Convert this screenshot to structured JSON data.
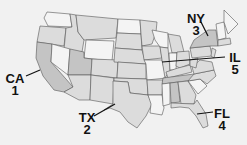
{
  "map": {
    "title": "US states map with labeled callouts",
    "colors": {
      "background": "#f1f1f1",
      "state_light": "#f4f4f4",
      "state_mid": "#dcdcdc",
      "state_dark": "#c4c4c4",
      "border": "#555555",
      "text": "#111111"
    },
    "callouts": [
      {
        "state": "CA",
        "number": "1"
      },
      {
        "state": "TX",
        "number": "2"
      },
      {
        "state": "NY",
        "number": "3"
      },
      {
        "state": "FL",
        "number": "4"
      },
      {
        "state": "IL",
        "number": "5"
      }
    ]
  }
}
